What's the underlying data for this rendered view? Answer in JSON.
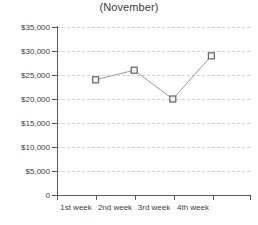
{
  "chart_data": {
    "type": "line",
    "title": "(November)",
    "xlabel": "",
    "ylabel": "",
    "categories": [
      "1st week",
      "2nd week",
      "3rd week",
      "4th week"
    ],
    "values": [
      24000,
      26000,
      20000,
      29000
    ],
    "series": [
      {
        "name": "sales",
        "values": [
          24000,
          26000,
          20000,
          29000
        ]
      }
    ],
    "ylim": [
      0,
      35000
    ],
    "yticks": [
      0,
      5000,
      10000,
      15000,
      20000,
      25000,
      30000,
      35000
    ],
    "ytick_labels": [
      "0",
      "$5,000",
      "$10,000",
      "$15,000",
      "$20,000",
      "$25,000",
      "$30,000",
      "$35,000"
    ],
    "grid": true,
    "grid_style": "dashed",
    "legend": false,
    "legend_position": "none",
    "marker": "square",
    "colors": {
      "line": "#9a9a9a",
      "marker_stroke": "#6e6e6e",
      "marker_fill": "#f2f2f2",
      "grid": "#d2d2d2",
      "axis": "#5a5a5a",
      "text": "#3d3d3d",
      "background": "#ffffff"
    }
  }
}
